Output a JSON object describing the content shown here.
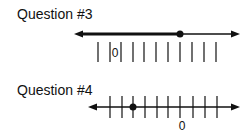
{
  "questions": [
    {
      "label": "Question #3",
      "line_y": 34,
      "x_start": 74,
      "x_end": 240,
      "ticks_x": [
        98,
        110,
        121,
        133,
        144,
        156,
        168,
        180,
        192,
        204,
        216
      ],
      "tick_top": 42,
      "tick_bottom": 62,
      "zero_label": "0",
      "zero_x": 115,
      "zero_y": 57,
      "dot_x": 180,
      "shaded": "left",
      "shaded_from": 74,
      "shaded_to": 180
    },
    {
      "label": "Question #4",
      "line_y": 107,
      "x_start": 88,
      "x_end": 240,
      "ticks_x": [
        110,
        122,
        133,
        145,
        157,
        168,
        180,
        193,
        205,
        217
      ],
      "tick_top": 96,
      "tick_bottom": 118,
      "zero_label": "0",
      "zero_x": 182,
      "zero_y": 130,
      "dot_x": 133,
      "shaded": "none"
    }
  ],
  "colors": {
    "ink": "#111111",
    "background": "#ffffff"
  }
}
